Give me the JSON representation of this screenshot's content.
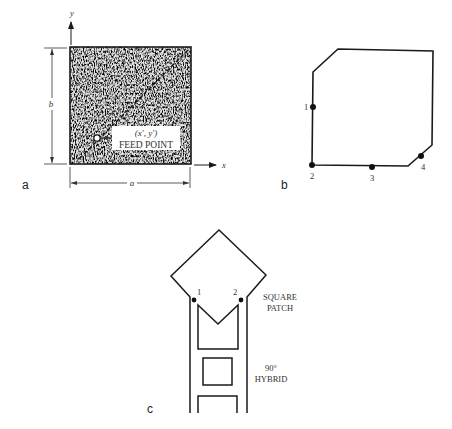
{
  "panels": {
    "a": {
      "label": "a",
      "axes": {
        "x_label": "x",
        "y_label": "y"
      },
      "dimensions": {
        "width_label": "a",
        "height_label": "b"
      },
      "feed_point": {
        "coord_label": "(x′, y′)",
        "label": "FEED POINT"
      }
    },
    "b": {
      "label": "b",
      "points": [
        {
          "label": "1"
        },
        {
          "label": "2"
        },
        {
          "label": "3"
        },
        {
          "label": "4"
        }
      ]
    },
    "c": {
      "label": "c",
      "ports": [
        {
          "label": "1"
        },
        {
          "label": "2"
        }
      ],
      "annotations": {
        "patch_line1": "SQUARE",
        "patch_line2": "PATCH",
        "hybrid_line1": "90°",
        "hybrid_line2": "HYBRID"
      }
    }
  },
  "colors": {
    "stroke": "#1a1a1a",
    "stipple_base": "#8f8f8f",
    "stipple_dark": "#3a3a3a",
    "stipple_light": "#e8e8e8"
  }
}
